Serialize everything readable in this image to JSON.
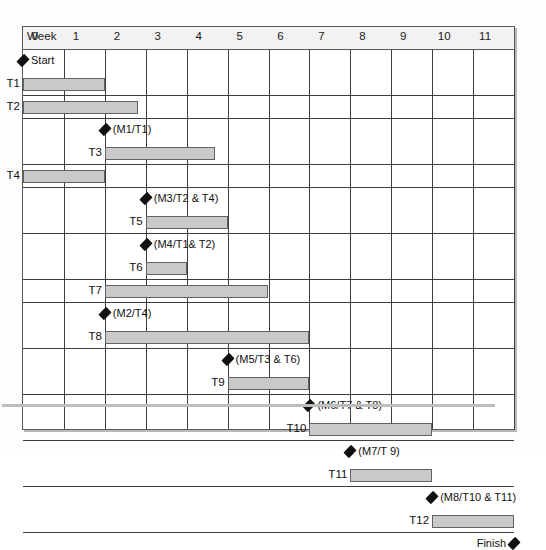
{
  "chart": {
    "type": "gantt",
    "axis_title": "Week",
    "week_ticks": [
      0,
      1,
      2,
      3,
      4,
      5,
      6,
      7,
      8,
      9,
      10,
      11
    ],
    "week_min": 0,
    "week_max": 12.0,
    "bar_color": "#c9c9c9",
    "bar_border_color": "#636363",
    "grid_color": "#3d3d3d",
    "header_bg": "#f2f2f2",
    "marker_color": "#111111"
  },
  "chart_data": {
    "type": "bar",
    "title": "",
    "xlabel": "Week",
    "ylabel": "",
    "xlim": [
      0,
      12.0
    ],
    "grid": true,
    "legend": "none",
    "categories": [
      "Start",
      "T1",
      "T2",
      "M1/T1",
      "T3",
      "T4",
      "M3/T2 & T4",
      "T5",
      "M4/T1& T2",
      "T6",
      "T7",
      "M2/T4",
      "T8",
      "M5/T3 & T6",
      "T9",
      "M6/T7 & T8",
      "T10",
      "M7/T 9",
      "T11",
      "M8/T10 & T11",
      "T12",
      "Finish"
    ],
    "rows": [
      {
        "row": 0,
        "kind": "milestone",
        "label": "Start",
        "week": 0.0,
        "label_side": "right"
      },
      {
        "row": 1,
        "kind": "task",
        "label": "T1",
        "start": 0.0,
        "end": 2.0
      },
      {
        "row": 2,
        "kind": "task",
        "label": "T2",
        "start": 0.0,
        "end": 2.8
      },
      {
        "row": 3,
        "kind": "milestone",
        "label": "(M1/T1)",
        "week": 2.0,
        "label_side": "right"
      },
      {
        "row": 4,
        "kind": "task",
        "label": "T3",
        "start": 2.0,
        "end": 4.7
      },
      {
        "row": 5,
        "kind": "task",
        "label": "T4",
        "start": 0.0,
        "end": 2.0
      },
      {
        "row": 6,
        "kind": "milestone",
        "label": "(M3/T2 & T4)",
        "week": 3.0,
        "label_side": "right"
      },
      {
        "row": 7,
        "kind": "task",
        "label": "T5",
        "start": 3.0,
        "end": 5.0
      },
      {
        "row": 8,
        "kind": "milestone",
        "label": "(M4/T1& T2)",
        "week": 3.0,
        "label_side": "right"
      },
      {
        "row": 9,
        "kind": "task",
        "label": "T6",
        "start": 3.0,
        "end": 4.0
      },
      {
        "row": 10,
        "kind": "task",
        "label": "T7",
        "start": 2.0,
        "end": 6.0
      },
      {
        "row": 11,
        "kind": "milestone",
        "label": "(M2/T4)",
        "week": 2.0,
        "label_side": "right"
      },
      {
        "row": 12,
        "kind": "task",
        "label": "T8",
        "start": 2.0,
        "end": 7.0
      },
      {
        "row": 13,
        "kind": "milestone",
        "label": "(M5/T3 & T6)",
        "week": 5.0,
        "label_side": "right"
      },
      {
        "row": 14,
        "kind": "task",
        "label": "T9",
        "start": 5.0,
        "end": 7.0
      },
      {
        "row": 15,
        "kind": "milestone",
        "label": "(M6/T7 & T8)",
        "week": 7.0,
        "label_side": "right"
      },
      {
        "row": 16,
        "kind": "task",
        "label": "T10",
        "start": 7.0,
        "end": 10.0
      },
      {
        "row": 17,
        "kind": "milestone",
        "label": "(M7/T 9)",
        "week": 8.0,
        "label_side": "right"
      },
      {
        "row": 18,
        "kind": "task",
        "label": "T11",
        "start": 8.0,
        "end": 10.0
      },
      {
        "row": 19,
        "kind": "milestone",
        "label": "(M8/T10 & T11)",
        "week": 10.0,
        "label_side": "right"
      },
      {
        "row": 20,
        "kind": "task",
        "label": "T12",
        "start": 10.0,
        "end": 12.0
      },
      {
        "row": 21,
        "kind": "milestone",
        "label": "Finish",
        "week": 12.0,
        "label_side": "left"
      }
    ]
  }
}
